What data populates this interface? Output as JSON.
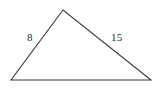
{
  "figure": {
    "type": "triangle-diagram",
    "background_color": "#ffffff",
    "stroke_color": "#3a3a3a",
    "stroke_width": 1.1,
    "label_color": "#2b2b2b",
    "canvas": {
      "width": 163,
      "height": 91
    },
    "vertices": {
      "apex": {
        "x": 63,
        "y": 10
      },
      "bottom_left": {
        "x": 11,
        "y": 80
      },
      "bottom_right": {
        "x": 151,
        "y": 80
      }
    },
    "polygon_points": "63,10 11,80 151,80",
    "labels": {
      "left_side": "8",
      "right_side": "15",
      "bottom_side": ""
    },
    "sides": [
      {
        "name": "left-side",
        "from": "bottom_left",
        "to": "apex",
        "label": "8"
      },
      {
        "name": "right-side",
        "from": "apex",
        "to": "bottom_right",
        "label": "15"
      },
      {
        "name": "bottom-side",
        "from": "bottom_left",
        "to": "bottom_right",
        "label": ""
      }
    ]
  }
}
